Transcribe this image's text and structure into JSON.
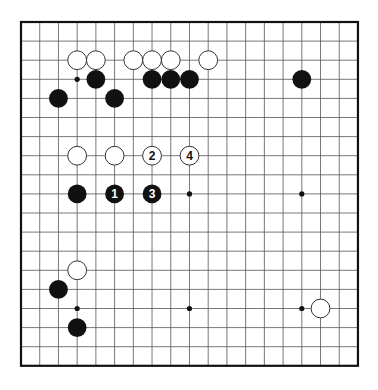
{
  "board": {
    "size": 19,
    "origin_x": 21,
    "origin_y": 22,
    "spacing_x": 18.72,
    "spacing_y": 19.1,
    "stone_radius": 9.4,
    "colors": {
      "background": "#ffffff",
      "grid_line": "#555555",
      "border": "#111111",
      "black_stone": "#111111",
      "white_stone_fill": "#ffffff",
      "white_stone_stroke": "#333333"
    }
  },
  "star_points": [
    {
      "col": 3,
      "row": 3
    },
    {
      "col": 9,
      "row": 9
    },
    {
      "col": 15,
      "row": 9
    },
    {
      "col": 3,
      "row": 15
    },
    {
      "col": 9,
      "row": 15
    },
    {
      "col": 15,
      "row": 15
    }
  ],
  "stones": [
    {
      "color": "white",
      "col": 3,
      "row": 2,
      "label": ""
    },
    {
      "color": "white",
      "col": 4,
      "row": 2,
      "label": ""
    },
    {
      "color": "white",
      "col": 6,
      "row": 2,
      "label": ""
    },
    {
      "color": "white",
      "col": 7,
      "row": 2,
      "label": ""
    },
    {
      "color": "white",
      "col": 8,
      "row": 2,
      "label": ""
    },
    {
      "color": "white",
      "col": 10,
      "row": 2,
      "label": ""
    },
    {
      "color": "black",
      "col": 4,
      "row": 3,
      "label": ""
    },
    {
      "color": "black",
      "col": 7,
      "row": 3,
      "label": ""
    },
    {
      "color": "black",
      "col": 8,
      "row": 3,
      "label": ""
    },
    {
      "color": "black",
      "col": 9,
      "row": 3,
      "label": ""
    },
    {
      "color": "black",
      "col": 15,
      "row": 3,
      "label": ""
    },
    {
      "color": "black",
      "col": 2,
      "row": 4,
      "label": ""
    },
    {
      "color": "black",
      "col": 5,
      "row": 4,
      "label": ""
    },
    {
      "color": "white",
      "col": 3,
      "row": 7,
      "label": ""
    },
    {
      "color": "white",
      "col": 5,
      "row": 7,
      "label": ""
    },
    {
      "color": "white",
      "col": 7,
      "row": 7,
      "label": "2"
    },
    {
      "color": "white",
      "col": 9,
      "row": 7,
      "label": "4"
    },
    {
      "color": "black",
      "col": 3,
      "row": 9,
      "label": ""
    },
    {
      "color": "black",
      "col": 5,
      "row": 9,
      "label": "1"
    },
    {
      "color": "black",
      "col": 7,
      "row": 9,
      "label": "3"
    },
    {
      "color": "white",
      "col": 3,
      "row": 13,
      "label": ""
    },
    {
      "color": "black",
      "col": 2,
      "row": 14,
      "label": ""
    },
    {
      "color": "white",
      "col": 16,
      "row": 15,
      "label": ""
    },
    {
      "color": "black",
      "col": 3,
      "row": 16,
      "label": ""
    }
  ]
}
